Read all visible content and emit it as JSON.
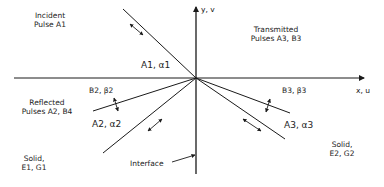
{
  "figure": {
    "axes": {
      "y_label": "y, v",
      "x_label": "x, u"
    },
    "regions": {
      "incident": {
        "line1": "Incident",
        "line2": "Pulse A1"
      },
      "transmitted": {
        "line1": "Transmitted",
        "line2": "Pulses A3, B3"
      },
      "reflected": {
        "line1": "Reflected",
        "line2": "Pulses A2, B4"
      },
      "solid_left": {
        "line1": "Solid,",
        "line2": "E1, G1"
      },
      "solid_right": {
        "line1": "Solid,",
        "line2": "E2, G2"
      }
    },
    "wave_labels": {
      "a1": "A1, α1",
      "b2": "B2, β2",
      "a2": "A2, α2",
      "b3": "B3, β3",
      "a3": "A3, α3"
    },
    "interface_label": "Interface",
    "colors": {
      "line": "#1a1a1a",
      "text": "#222222",
      "background": "#ffffff"
    }
  }
}
